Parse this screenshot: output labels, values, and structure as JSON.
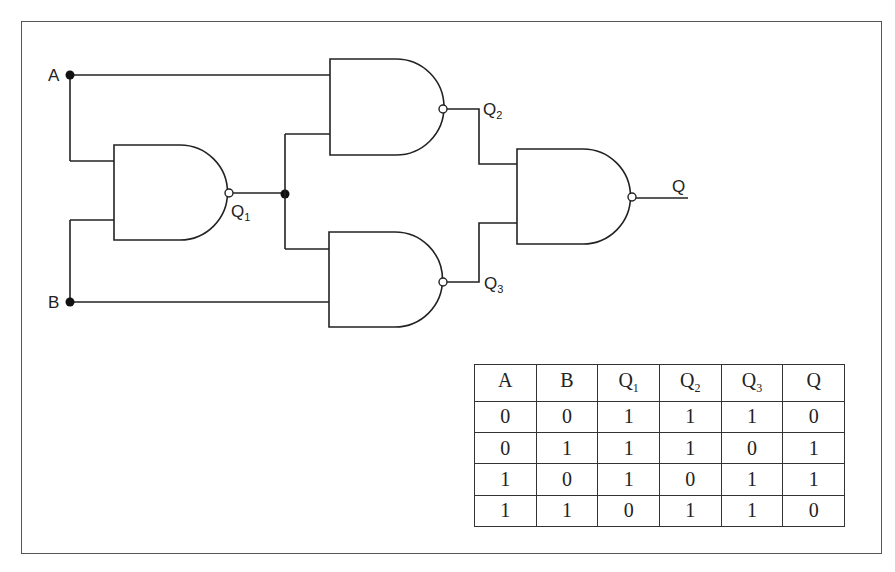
{
  "diagram": {
    "type": "logic-circuit",
    "gate_type": "NAND",
    "inputs": [
      {
        "label": "A"
      },
      {
        "label": "B"
      }
    ],
    "gates": [
      {
        "id": "G1",
        "output": "Q1",
        "inputs": [
          "A",
          "B"
        ]
      },
      {
        "id": "G2",
        "output": "Q2",
        "inputs": [
          "A",
          "Q1"
        ]
      },
      {
        "id": "G3",
        "output": "Q3",
        "inputs": [
          "Q1",
          "B"
        ]
      },
      {
        "id": "G4",
        "output": "Q",
        "inputs": [
          "Q2",
          "Q3"
        ]
      }
    ],
    "labels": {
      "A": "A",
      "B": "B",
      "Q1_base": "Q",
      "Q1_sub": "1",
      "Q2_base": "Q",
      "Q2_sub": "2",
      "Q3_base": "Q",
      "Q3_sub": "3",
      "Q": "Q"
    }
  },
  "truth_table": {
    "headers": [
      {
        "base": "A",
        "sub": ""
      },
      {
        "base": "B",
        "sub": ""
      },
      {
        "base": "Q",
        "sub": "1"
      },
      {
        "base": "Q",
        "sub": "2"
      },
      {
        "base": "Q",
        "sub": "3"
      },
      {
        "base": "Q",
        "sub": ""
      }
    ],
    "rows": [
      [
        "0",
        "0",
        "1",
        "1",
        "1",
        "0"
      ],
      [
        "0",
        "1",
        "1",
        "1",
        "0",
        "1"
      ],
      [
        "1",
        "0",
        "1",
        "0",
        "1",
        "1"
      ],
      [
        "1",
        "1",
        "0",
        "1",
        "1",
        "0"
      ]
    ]
  }
}
